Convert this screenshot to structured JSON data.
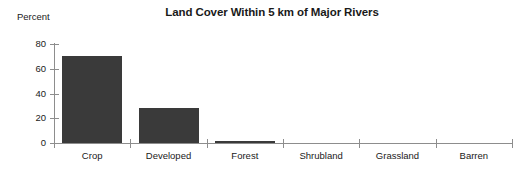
{
  "chart_data": {
    "type": "bar",
    "title": "Land Cover Within 5 km of Major Rivers",
    "xlabel": "",
    "ylabel": "Percent",
    "categories": [
      "Crop",
      "Developed",
      "Forest",
      "Shrubland",
      "Grassland",
      "Barren"
    ],
    "values": [
      70,
      28,
      1.5,
      0,
      0,
      0
    ],
    "ylim": [
      0,
      80
    ],
    "yticks": [
      0,
      20,
      40,
      60,
      80
    ],
    "ytick_labels": [
      "0",
      "20",
      "40",
      "60",
      "80"
    ],
    "grid": false,
    "legend": null,
    "colors": {
      "background": "#ffffff",
      "bar_fill": "#3a3a3a",
      "axis": "#8d8d8d",
      "text": "#1a1a1a"
    }
  }
}
